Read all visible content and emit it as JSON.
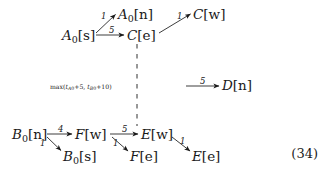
{
  "figure": {
    "type": "directed-graph",
    "equation_number": "(34)",
    "nodes": [
      {
        "id": "A0n",
        "label": "A0[n]",
        "base": "A",
        "sub": "0",
        "rest": "[n]",
        "x": 118,
        "y": 8
      },
      {
        "id": "Cw",
        "label": "C[w]",
        "base": "C",
        "sub": "",
        "rest": "[w]",
        "x": 193,
        "y": 8
      },
      {
        "id": "A0s",
        "label": "A0[s]",
        "base": "A",
        "sub": "0",
        "rest": "[s]",
        "x": 62,
        "y": 29
      },
      {
        "id": "Ce",
        "label": "C[e]",
        "base": "C",
        "sub": "",
        "rest": "[e]",
        "x": 127,
        "y": 29
      },
      {
        "id": "Dn",
        "label": "D[n]",
        "base": "D",
        "sub": "",
        "rest": "[n]",
        "x": 222,
        "y": 80
      },
      {
        "id": "B0n",
        "label": "B0[n]",
        "base": "B",
        "sub": "0",
        "rest": "[n]",
        "x": 12,
        "y": 128
      },
      {
        "id": "Fw",
        "label": "F[w]",
        "base": "F",
        "sub": "",
        "rest": "[w]",
        "x": 75,
        "y": 128
      },
      {
        "id": "Ew",
        "label": "E[w]",
        "base": "E",
        "sub": "",
        "rest": "[w]",
        "x": 141,
        "y": 128
      },
      {
        "id": "B0s",
        "label": "B0[s]",
        "base": "B",
        "sub": "0",
        "rest": "[s]",
        "x": 63,
        "y": 150
      },
      {
        "id": "Fe",
        "label": "F[e]",
        "base": "F",
        "sub": "",
        "rest": "[e]",
        "x": 130,
        "y": 150
      },
      {
        "id": "Ee",
        "label": "E[e]",
        "base": "E",
        "sub": "",
        "rest": "[e]",
        "x": 192,
        "y": 150
      }
    ],
    "edges": [
      {
        "id": "e1",
        "from": "A0s",
        "to": "A0n",
        "weight": "1",
        "label_x": 101,
        "label_y": 12
      },
      {
        "id": "e2",
        "from": "A0s",
        "to": "Ce",
        "weight": "5",
        "label_x": 109,
        "label_y": 27
      },
      {
        "id": "e3",
        "from": "Ce",
        "to": "Cw",
        "weight": "1",
        "label_x": 178,
        "label_y": 12
      },
      {
        "id": "e4",
        "from": "Dsrc",
        "to": "Dn",
        "weight": "5",
        "label_x": 201,
        "label_y": 78
      },
      {
        "id": "e5",
        "from": "B0n",
        "to": "Fw",
        "weight": "4",
        "label_x": 59,
        "label_y": 126
      },
      {
        "id": "e6",
        "from": "B0n",
        "to": "B0s",
        "weight": "1",
        "label_x": 38,
        "label_y": 140
      },
      {
        "id": "e7",
        "from": "Fw",
        "to": "Ew",
        "weight": "5",
        "label_x": 123,
        "label_y": 126
      },
      {
        "id": "e8",
        "from": "Fw",
        "to": "Fe",
        "weight": "1",
        "label_x": 112,
        "label_y": 140
      },
      {
        "id": "e9",
        "from": "Ew",
        "to": "Ee",
        "weight": "1",
        "label_x": 181,
        "label_y": 138
      }
    ],
    "dashed_edge": {
      "id": "d1",
      "from": "Ce",
      "to": "Ew",
      "style": "dashed",
      "label_prefix": "max(",
      "label_t1": "t",
      "label_t1_sub": "A",
      "label_t1_sub2": "0",
      "label_mid": "+5, ",
      "label_t2": "t",
      "label_t2_sub": "B",
      "label_t2_sub2": "0",
      "label_suffix": "+10)",
      "label_x": 50,
      "label_y": 84
    },
    "colors": {
      "ink": "#1a1a1a",
      "background": "#ffffff"
    }
  }
}
